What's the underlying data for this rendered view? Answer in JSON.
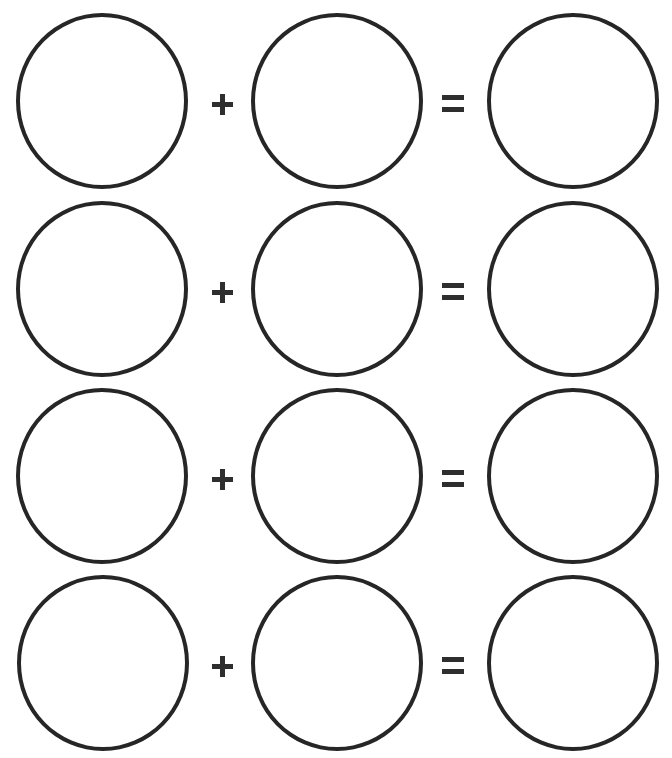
{
  "worksheet": {
    "stroke_color": "#262626",
    "background": "#ffffff",
    "rows": [
      {
        "left": {
          "value": ""
        },
        "operator": "+",
        "right": {
          "value": ""
        },
        "equals": "=",
        "result": {
          "value": ""
        }
      },
      {
        "left": {
          "value": ""
        },
        "operator": "+",
        "right": {
          "value": ""
        },
        "equals": "=",
        "result": {
          "value": ""
        }
      },
      {
        "left": {
          "value": ""
        },
        "operator": "+",
        "right": {
          "value": ""
        },
        "equals": "=",
        "result": {
          "value": ""
        }
      },
      {
        "left": {
          "value": ""
        },
        "operator": "+",
        "right": {
          "value": ""
        },
        "equals": "=",
        "result": {
          "value": ""
        }
      }
    ],
    "icons": {
      "operator": "plus-icon",
      "equals": "equals-icon"
    }
  }
}
